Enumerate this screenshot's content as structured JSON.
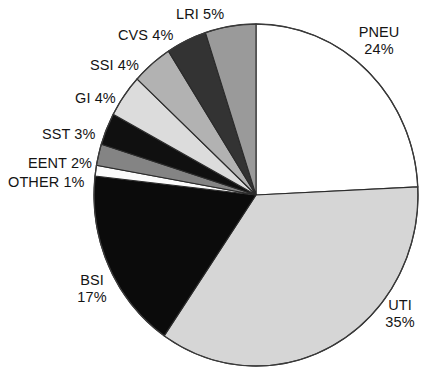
{
  "chart_data": {
    "type": "pie",
    "title": "",
    "subtitle": "",
    "xlabel": "",
    "ylabel": "",
    "legend_position": "none",
    "grid": false,
    "units": "percent",
    "total": 100,
    "start_angle_deg": 0,
    "direction": "clockwise",
    "categories": [
      "PNEU",
      "UTI",
      "BSI",
      "OTHER",
      "EENT",
      "SST",
      "GI",
      "SSI",
      "CVS",
      "LRI"
    ],
    "values": [
      24,
      35,
      17,
      1,
      2,
      3,
      4,
      4,
      4,
      5
    ],
    "slices": [
      {
        "name": "PNEU",
        "value": 24,
        "label": "PNEU",
        "percent": "24%",
        "color": "#ffffff"
      },
      {
        "name": "UTI",
        "value": 35,
        "label": "UTI",
        "percent": "35%",
        "color": "#d6d6d6"
      },
      {
        "name": "BSI",
        "value": 17,
        "label": "BSI",
        "percent": "17%",
        "color": "#0b0b0b"
      },
      {
        "name": "OTHER",
        "value": 1,
        "label": "OTHER",
        "percent": "1%",
        "color": "#fbfbfb"
      },
      {
        "name": "EENT",
        "value": 2,
        "label": "EENT",
        "percent": "2%",
        "color": "#848484"
      },
      {
        "name": "SST",
        "value": 3,
        "label": "SST",
        "percent": "3%",
        "color": "#101010"
      },
      {
        "name": "GI",
        "value": 4,
        "label": "GI",
        "percent": "4%",
        "color": "#dcdcdc"
      },
      {
        "name": "SSI",
        "value": 4,
        "label": "SSI",
        "percent": "4%",
        "color": "#b2b2b2"
      },
      {
        "name": "CVS",
        "value": 4,
        "label": "CVS",
        "percent": "4%",
        "color": "#333333"
      },
      {
        "name": "LRI",
        "value": 5,
        "label": "LRI",
        "percent": "5%",
        "color": "#9a9a9a"
      }
    ]
  },
  "labels": {
    "pneu": {
      "line1": "PNEU",
      "line2": "24%"
    },
    "uti": {
      "line1": "UTI",
      "line2": "35%"
    },
    "bsi": {
      "line1": "BSI",
      "line2": "17%"
    },
    "lri": {
      "text": "LRI 5%"
    },
    "cvs": {
      "text": "CVS 4%"
    },
    "ssi": {
      "text": "SSI 4%"
    },
    "gi": {
      "text": "GI 4%"
    },
    "sst": {
      "text": "SST 3%"
    },
    "eent": {
      "text": "EENT 2%"
    },
    "other": {
      "text": "OTHER 1%"
    }
  },
  "geometry": {
    "center_x": 256,
    "center_y": 195,
    "radius_x": 162,
    "radius_y": 171
  }
}
